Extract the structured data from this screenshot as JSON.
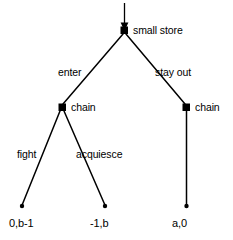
{
  "diagram": {
    "background_color": "#ffffff",
    "line_color": "#000000",
    "nodes": {
      "root": {
        "label": "small store",
        "shape": "filled-square",
        "x": 124,
        "y": 30
      },
      "chain_left": {
        "label": "chain",
        "shape": "filled-square",
        "x": 62,
        "y": 107
      },
      "chain_right": {
        "label": "chain",
        "shape": "filled-square",
        "x": 186,
        "y": 107
      },
      "terminal_fight": {
        "shape": "filled-dot",
        "x": 22,
        "y": 206
      },
      "terminal_acquiesce": {
        "shape": "filled-dot",
        "x": 105,
        "y": 206
      },
      "terminal_stayout": {
        "shape": "filled-dot",
        "x": 186,
        "y": 206
      }
    },
    "edges": {
      "enter": {
        "label": "enter",
        "label_x": 58,
        "label_y": 76
      },
      "stay_out": {
        "label": "stay out",
        "label_x": 155,
        "label_y": 76
      },
      "fight": {
        "label": "fight",
        "label_x": 17,
        "label_y": 158
      },
      "acquiesce": {
        "label": "acquiesce",
        "label_x": 76,
        "label_y": 158
      },
      "no_fight": {
        "label": ""
      }
    },
    "payoffs": {
      "fight_outcome": {
        "text": "0,b-1",
        "x": 9,
        "y": 227
      },
      "acquiesce_outcome": {
        "text": "-1,b",
        "x": 90,
        "y": 227
      },
      "stay_out_outcome": {
        "text": "a,0",
        "x": 172,
        "y": 227
      }
    },
    "entry_arrow": {
      "name": "initial-move-arrow",
      "from_y": 3,
      "to_y": 30,
      "x": 124
    }
  }
}
